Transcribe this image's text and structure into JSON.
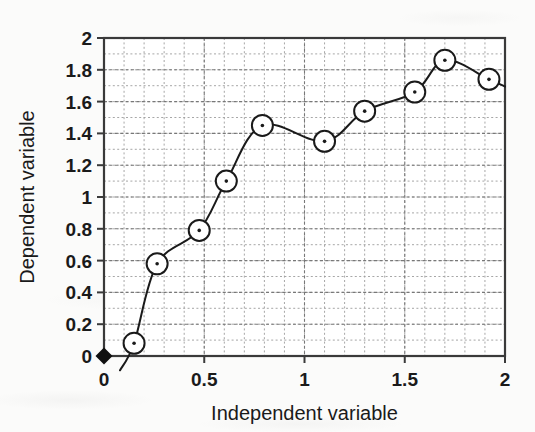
{
  "chart_data": {
    "type": "line",
    "title": "",
    "xlabel": "Independent variable",
    "ylabel": "Dependent variable",
    "xlim": [
      0,
      2
    ],
    "ylim": [
      0,
      2
    ],
    "xticks": [
      0,
      0.5,
      1,
      1.5,
      2
    ],
    "xtick_labels": [
      "0",
      "0.5",
      "1",
      "1.5",
      "2"
    ],
    "yticks": [
      0,
      0.2,
      0.4,
      0.6,
      0.8,
      1,
      1.2,
      1.4,
      1.6,
      1.8,
      2
    ],
    "ytick_labels": [
      "0",
      "0.2",
      "0.4",
      "0.6",
      "0.8",
      "1",
      "1.2",
      "1.4",
      "1.6",
      "1.8",
      "2"
    ],
    "grid": true,
    "grid_style": "dashed",
    "grid_minor_step_x": 0.1,
    "grid_minor_step_y": 0.1,
    "legend": null,
    "series": [
      {
        "name": "data",
        "marker": "open-circle",
        "line_style": "solid-smooth",
        "color": "#1a1a1a",
        "x": [
          0.15,
          0.265,
          0.475,
          0.61,
          0.79,
          1.1,
          1.3,
          1.55,
          1.7,
          1.92
        ],
        "y": [
          0.08,
          0.58,
          0.79,
          1.1,
          1.45,
          1.35,
          1.54,
          1.66,
          1.86,
          1.74
        ]
      },
      {
        "name": "origin",
        "marker": "filled-diamond",
        "line_style": "none",
        "color": "#111111",
        "x": [
          0
        ],
        "y": [
          0
        ]
      }
    ],
    "colors": {
      "line": "#1a1a1a",
      "marker_edge": "#1a1a1a",
      "marker_face": "#ffffff",
      "axis": "#3a3a3a",
      "grid": "#999999",
      "background": "#fbfbfa",
      "text": "#1a1a1a"
    }
  },
  "axes": {
    "x_label": "Independent variable",
    "y_label": "Dependent variable"
  }
}
